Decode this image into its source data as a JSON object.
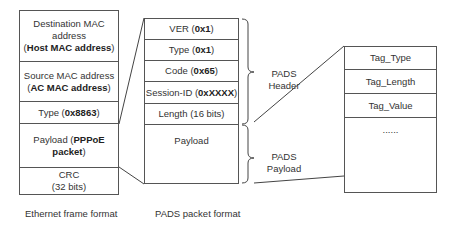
{
  "ethernet_frame": {
    "caption": "Ethernet frame format",
    "fields": [
      {
        "pre": "Destination MAC address (",
        "bold": "Host MAC address",
        "post": ")"
      },
      {
        "pre": "Source MAC address (",
        "bold": "AC MAC address",
        "post": ")"
      },
      {
        "pre": "Type (",
        "bold": "0x8863",
        "post": ")"
      },
      {
        "pre": "Payload (",
        "bold": "PPPoE packet",
        "post": ")"
      },
      {
        "pre": "CRC (32 bits)",
        "bold": "",
        "post": ""
      }
    ]
  },
  "pads_packet": {
    "caption": "PADS packet format",
    "fields": [
      {
        "pre": "VER (",
        "bold": "0x1",
        "post": ")"
      },
      {
        "pre": "Type (",
        "bold": "0x1",
        "post": ")"
      },
      {
        "pre": "Code (",
        "bold": "0x65",
        "post": ")"
      },
      {
        "pre": "Session-ID (",
        "bold": "0xXXXX",
        "post": ")"
      },
      {
        "pre": "Length (16 bits)",
        "bold": "",
        "post": ""
      },
      {
        "pre": "Payload",
        "bold": "",
        "post": ""
      }
    ],
    "brace_labels": {
      "header_line1": "PADS",
      "header_line2": "Header",
      "payload_line1": "PADS",
      "payload_line2": "Payload"
    }
  },
  "tag_format": {
    "fields": [
      "Tag_Type",
      "Tag_Length",
      "Tag_Value",
      "......"
    ]
  }
}
